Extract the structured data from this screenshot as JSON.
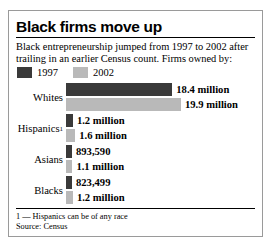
{
  "chart_data": {
    "type": "bar",
    "title": "Black firms move up",
    "subtitle": "Black entrepreneurship jumped from 1997 to 2002 after trailing in an earlier Census count. Firms owned by:",
    "orientation": "horizontal",
    "grid": false,
    "legend_position": "top-left",
    "categories": [
      "Whites",
      "Hispanics",
      "Asians",
      "Blacks"
    ],
    "category_footnote_markers": [
      "",
      "1",
      "",
      ""
    ],
    "series": [
      {
        "name": "1997",
        "color": "#3a3a3a",
        "values": [
          18400000,
          1200000,
          893590,
          823499
        ],
        "labels": [
          "18.4 million",
          "1.2 million",
          "893,590",
          "823,499"
        ]
      },
      {
        "name": "2002",
        "color": "#b9b9b9",
        "values": [
          19900000,
          1600000,
          1100000,
          1200000
        ],
        "labels": [
          "19.9 million",
          "1.6 million",
          "1.1 million",
          "1.2 million"
        ]
      }
    ],
    "xlabel": "",
    "ylabel": "",
    "xlim": [
      0,
      19900000
    ],
    "footnote": "1 — Hispanics can be of any race",
    "source": "Source: Census"
  }
}
